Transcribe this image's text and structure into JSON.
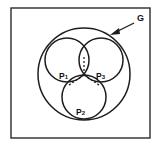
{
  "figure": {
    "caption": "",
    "frame": {
      "x": 11,
      "y": 8,
      "width": 139,
      "height": 130,
      "stroke_color": "#2b2b2b"
    },
    "outer_region": {
      "label": "G",
      "label_base": "G",
      "label_subscript": "",
      "label_x": 139,
      "label_y": 20,
      "center_x": 84,
      "center_y": 74,
      "radius": 46,
      "stroke_color": "#1d1d1d"
    },
    "annotation_arrow": {
      "name": "arrow-to-G",
      "from_x": 134,
      "from_y": 24,
      "to_x": 111,
      "to_y": 35
    },
    "inner_circles": [
      {
        "label": "P1",
        "label_base": "P",
        "label_subscript": "1",
        "center_x": 67,
        "center_y": 60,
        "radius": 22,
        "label_x": 62,
        "label_y": 77,
        "stroke_color": "#1d1d1d"
      },
      {
        "label": "P2",
        "label_base": "P",
        "label_subscript": "2",
        "center_x": 84,
        "center_y": 97,
        "radius": 22,
        "label_x": 79,
        "label_y": 113,
        "stroke_color": "#1d1d1d"
      },
      {
        "label": "P3",
        "label_base": "P",
        "label_subscript": "3",
        "center_x": 101,
        "center_y": 60,
        "radius": 22,
        "label_x": 99,
        "label_y": 77,
        "stroke_color": "#1d1d1d"
      }
    ],
    "dashed_radii": {
      "center_x": 84,
      "center_y": 75,
      "endpoints": [
        {
          "x": 84,
          "y": 57
        },
        {
          "x": 70,
          "y": 84
        },
        {
          "x": 98,
          "y": 84
        }
      ],
      "stroke_color": "#1d1d1d"
    },
    "background_color": "#ffffff"
  }
}
